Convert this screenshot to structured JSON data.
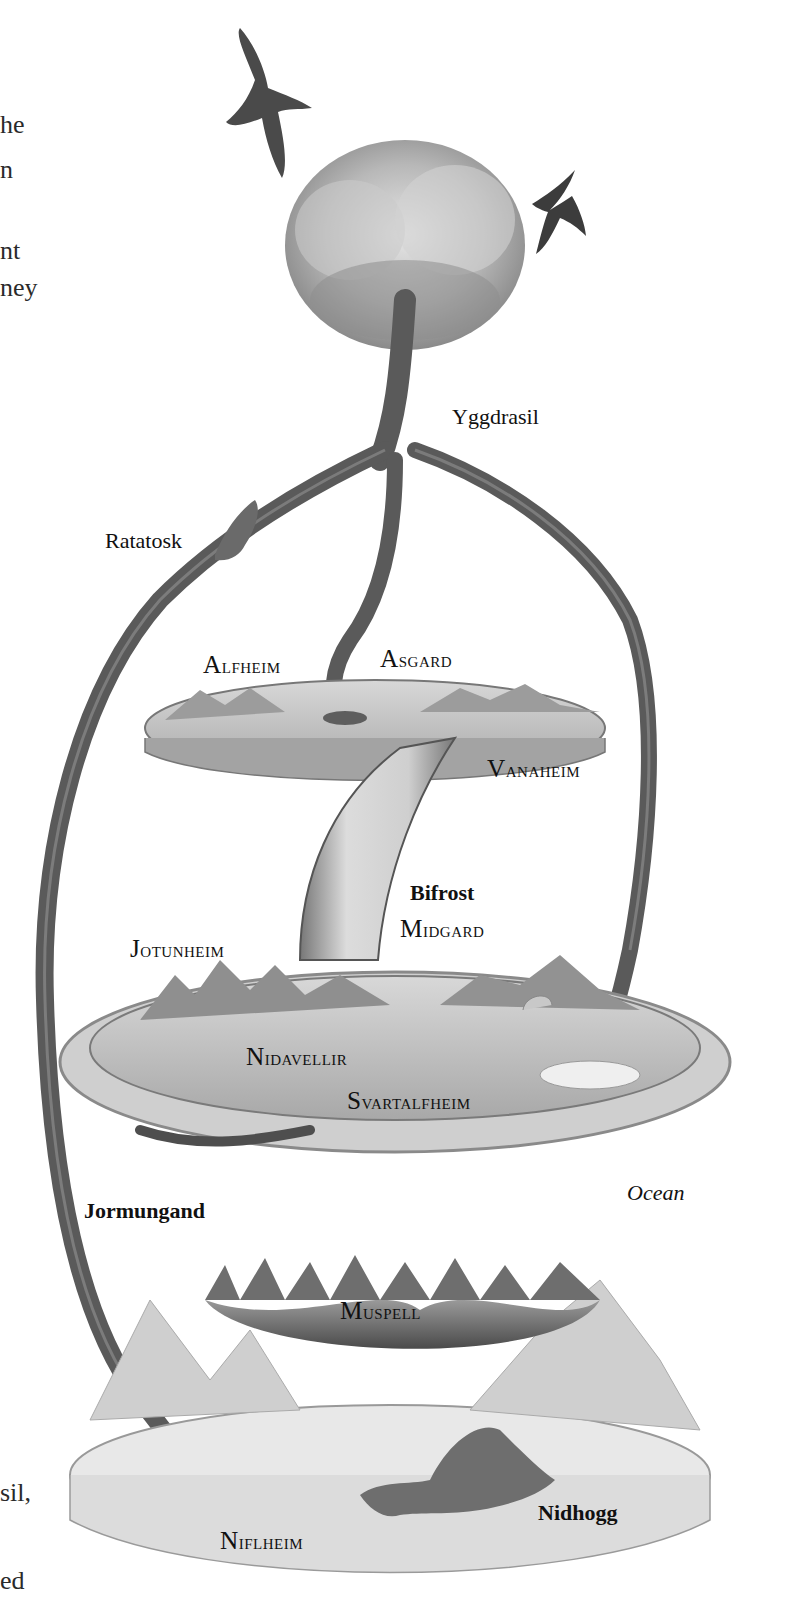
{
  "edge_text_fragments": [
    "he",
    "n",
    "nt",
    "ney",
    "sil,",
    "ed"
  ],
  "illustration": {
    "subject": "Yggdrasil world tree and the nine realms",
    "labels": {
      "yggdrasil": "Yggdrasil",
      "ratatosk": "Ratatosk",
      "alfheim": "Alfheim",
      "asgard": "Asgard",
      "vanaheim": "Vanaheim",
      "bifrost": "Bifrost",
      "midgard": "Midgard",
      "jotunheim": "Jotunheim",
      "nidavellir": "Nidavellir",
      "svartalfheim": "Svartalfheim",
      "jormungand": "Jormungand",
      "ocean": "Ocean",
      "muspell": "Muspell",
      "niflheim": "Niflheim",
      "nidhogg": "Nidhogg"
    }
  },
  "colors": {
    "background": "#ffffff",
    "ink": "#111111",
    "pencil": "#6a6a6a"
  }
}
